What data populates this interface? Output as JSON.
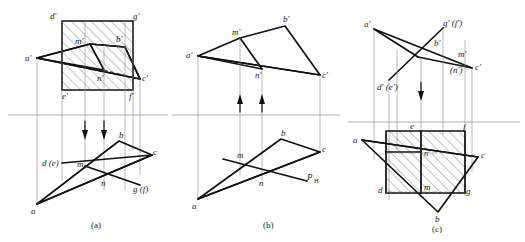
{
  "figure": {
    "title_captions": [
      "(a)",
      "(b)",
      "(c)"
    ],
    "colors": {
      "line": "#111111",
      "thin_line": "#8a8a8a",
      "axis": "#9a9a9a",
      "hatch": "#555555",
      "background": "#ffffff"
    }
  },
  "diagram_a": {
    "caption": "(a)",
    "frontal_labels": {
      "d_prime": "d′",
      "g_prime": "g′",
      "a_prime": "a′",
      "b_prime": "b′",
      "c_prime": "c′",
      "m_prime": "m′",
      "n_prime": "n′",
      "e_prime": "e′",
      "f_prime": "f′"
    },
    "horizontal_labels": {
      "a": "a",
      "b": "b",
      "c": "c",
      "m": "m",
      "n": "n",
      "d_e": "d (e)",
      "g_f": "g (f)"
    },
    "arrows": "two downward projection arrows",
    "hatched_region": "frontal rectangle d′g′f′e′"
  },
  "diagram_b": {
    "caption": "(b)",
    "frontal_labels": {
      "a_prime": "a′",
      "b_prime": "b′",
      "c_prime": "c′",
      "m_prime": "m′",
      "n_prime": "n′"
    },
    "horizontal_labels": {
      "a": "a",
      "b": "b",
      "c": "c",
      "m": "m",
      "n": "n",
      "p_h": "P",
      "p_h_sub": "H"
    },
    "arrows": "two upward projection arrows"
  },
  "diagram_c": {
    "caption": "(c)",
    "frontal_labels": {
      "a_prime": "a′",
      "b_prime": "b′",
      "c_prime": "c′",
      "g_f_prime": "g′ (f′)",
      "m_prime": "m′",
      "n_prime": "(n′)",
      "d_e_prime": "d′ (e′)"
    },
    "horizontal_labels": {
      "a": "a",
      "b": "b",
      "c": "c",
      "d": "d",
      "e": "e",
      "f": "f",
      "g": "g",
      "m": "m",
      "n": "n"
    },
    "arrows": "one downward projection arrow",
    "hatched_region": "horizontal rectangle defgh visible portion"
  }
}
